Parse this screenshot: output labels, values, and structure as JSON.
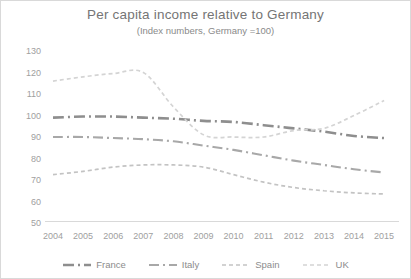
{
  "chart_data": {
    "type": "line",
    "title": "Per capita income relative to Germany",
    "subtitle": "(Index numbers, Germany =100)",
    "categories": [
      "2004",
      "2005",
      "2006",
      "2007",
      "2008",
      "2009",
      "2010",
      "2011",
      "2012",
      "2013",
      "2014",
      "2015"
    ],
    "series": [
      {
        "name": "France",
        "values": [
          99,
          99.5,
          99.5,
          99,
          98.5,
          97.5,
          97,
          95.5,
          94,
          92.5,
          90.5,
          89.5
        ],
        "color": "#8e8e8e",
        "dash": "long-dash-dot",
        "width": 2.6
      },
      {
        "name": "Italy",
        "values": [
          90,
          90,
          89.5,
          89,
          88,
          86,
          84,
          81.5,
          79,
          77,
          75,
          73.5
        ],
        "color": "#a8a8a8",
        "dash": "dash-dot",
        "width": 2.1
      },
      {
        "name": "Spain",
        "values": [
          72.5,
          74,
          76,
          77,
          77,
          76,
          72.5,
          69,
          66.5,
          65,
          64,
          63.5
        ],
        "color": "#c3c3c3",
        "dash": "dash",
        "width": 1.7
      },
      {
        "name": "UK",
        "values": [
          116,
          118,
          119.5,
          120,
          104,
          91,
          90,
          90,
          93,
          94,
          100,
          107
        ],
        "color": "#d4d4d4",
        "dash": "dash",
        "width": 1.7
      }
    ],
    "ylim": [
      50,
      130
    ],
    "ytick_step": 10,
    "xlabel": "",
    "ylabel": "",
    "grid": false,
    "legend_position": "bottom"
  },
  "colors": {
    "title_text": "#757575",
    "axis_text": "#a0a0a0",
    "axis_line": "#d9d9d9",
    "background": "#ffffff"
  }
}
